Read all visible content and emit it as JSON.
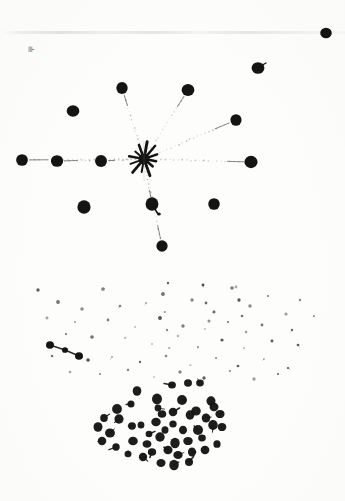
{
  "figure": {
    "caption": "",
    "corner_mark_label": "⊪",
    "background_color": "#fdfdfc",
    "ink_color": "#141414",
    "faint_ink_color": "#8d8d8d"
  },
  "chart_data": {
    "type": "scatter",
    "xlabel": "",
    "ylabel": "",
    "xlim": [
      0,
      345
    ],
    "ylim": [
      0,
      501
    ],
    "grid": false,
    "legend": null,
    "series": [
      {
        "name": "center-node",
        "marker": "starburst",
        "radius": 9,
        "points": [
          [
            144,
            159
          ]
        ]
      },
      {
        "name": "primary-nodes",
        "marker": "filled-circle",
        "radius": 6.0,
        "points": [
          [
            122,
            88
          ],
          [
            188,
            90
          ],
          [
            73,
            111
          ],
          [
            236,
            120
          ],
          [
            22,
            160
          ],
          [
            57,
            161
          ],
          [
            101,
            161
          ],
          [
            251,
            162
          ],
          [
            84,
            207
          ],
          [
            152,
            204
          ],
          [
            214,
            204
          ],
          [
            162,
            246
          ],
          [
            326,
            33
          ],
          [
            258,
            68
          ]
        ]
      },
      {
        "name": "rays",
        "marker": "dotted-line",
        "from": [
          144,
          159
        ],
        "to": [
          [
            122,
            88
          ],
          [
            188,
            90
          ],
          [
            236,
            120
          ],
          [
            101,
            161
          ],
          [
            251,
            162
          ],
          [
            152,
            204
          ],
          [
            162,
            246
          ],
          [
            57,
            161
          ],
          [
            22,
            160
          ]
        ]
      },
      {
        "name": "left-chain",
        "marker": "filled-circle",
        "radius": 4.0,
        "points": [
          [
            50,
            345
          ],
          [
            65,
            350
          ],
          [
            79,
            356
          ]
        ]
      },
      {
        "name": "lower-cluster",
        "marker": "filled-circle-with-tail",
        "radius": 4.2,
        "points": [
          [
            137,
            391
          ],
          [
            157,
            399
          ],
          [
            172,
            385
          ],
          [
            188,
            383
          ],
          [
            200,
            383
          ],
          [
            117,
            409
          ],
          [
            131,
            404
          ],
          [
            158,
            408
          ],
          [
            182,
            400
          ],
          [
            211,
            401
          ],
          [
            162,
            414
          ],
          [
            173,
            412
          ],
          [
            196,
            411
          ],
          [
            214,
            407
          ],
          [
            104,
            418
          ],
          [
            119,
            419
          ],
          [
            141,
            425
          ],
          [
            156,
            422
          ],
          [
            173,
            424
          ],
          [
            190,
            415
          ],
          [
            206,
            418
          ],
          [
            220,
            414
          ],
          [
            98,
            427
          ],
          [
            110,
            433
          ],
          [
            132,
            426
          ],
          [
            149,
            434
          ],
          [
            165,
            430
          ],
          [
            183,
            430
          ],
          [
            198,
            430
          ],
          [
            213,
            425
          ],
          [
            222,
            427
          ],
          [
            102,
            441
          ],
          [
            116,
            447
          ],
          [
            133,
            441
          ],
          [
            147,
            444
          ],
          [
            160,
            437
          ],
          [
            175,
            443
          ],
          [
            188,
            441
          ],
          [
            202,
            438
          ],
          [
            217,
            444
          ],
          [
            128,
            454
          ],
          [
            143,
            457
          ],
          [
            152,
            452
          ],
          [
            168,
            450
          ],
          [
            178,
            455
          ],
          [
            192,
            452
          ],
          [
            205,
            450
          ],
          [
            161,
            463
          ],
          [
            174,
            465
          ],
          [
            189,
            462
          ]
        ]
      },
      {
        "name": "faint-halo",
        "marker": "speck",
        "radius": 1.3,
        "points": [
          [
            38,
            290
          ],
          [
            103,
            289
          ],
          [
            168,
            283
          ],
          [
            232,
            288
          ],
          [
            268,
            296
          ],
          [
            300,
            300
          ],
          [
            58,
            302
          ],
          [
            82,
            309
          ],
          [
            120,
            306
          ],
          [
            146,
            303
          ],
          [
            192,
            300
          ],
          [
            214,
            312
          ],
          [
            250,
            306
          ],
          [
            286,
            314
          ],
          [
            314,
            316
          ],
          [
            47,
            318
          ],
          [
            75,
            322
          ],
          [
            108,
            320
          ],
          [
            135,
            327
          ],
          [
            160,
            318
          ],
          [
            183,
            326
          ],
          [
            205,
            329
          ],
          [
            228,
            322
          ],
          [
            262,
            325
          ],
          [
            292,
            330
          ],
          [
            66,
            334
          ],
          [
            92,
            337
          ],
          [
            125,
            338
          ],
          [
            152,
            344
          ],
          [
            178,
            336
          ],
          [
            198,
            347
          ],
          [
            222,
            340
          ],
          [
            244,
            348
          ],
          [
            272,
            341
          ],
          [
            298,
            345
          ],
          [
            52,
            356
          ],
          [
            88,
            360
          ],
          [
            112,
            357
          ],
          [
            140,
            362
          ],
          [
            166,
            356
          ],
          [
            190,
            365
          ],
          [
            216,
            358
          ],
          [
            238,
            366
          ],
          [
            264,
            359
          ],
          [
            288,
            368
          ],
          [
            70,
            372
          ],
          [
            100,
            374
          ],
          [
            128,
            370
          ],
          [
            154,
            377
          ],
          [
            180,
            372
          ],
          [
            204,
            378
          ],
          [
            230,
            371
          ],
          [
            254,
            379
          ],
          [
            278,
            374
          ],
          [
            236,
            287
          ],
          [
            239,
            300
          ],
          [
            242,
            316
          ],
          [
            246,
            332
          ],
          [
            163,
            294
          ],
          [
            165,
            312
          ],
          [
            167,
            330
          ],
          [
            169,
            348
          ],
          [
            203,
            285
          ],
          [
            206,
            303
          ],
          [
            209,
            321
          ]
        ]
      }
    ]
  }
}
